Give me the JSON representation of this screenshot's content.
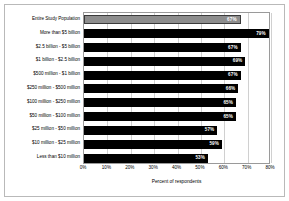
{
  "chart_data": {
    "type": "bar",
    "orientation": "horizontal",
    "title": "",
    "xlabel": "Percent of respondents",
    "ylabel": "",
    "xlim": [
      0,
      80
    ],
    "xticks": [
      "0%",
      "10%",
      "20%",
      "30%",
      "40%",
      "50%",
      "60%",
      "70%",
      "80%"
    ],
    "xtick_values": [
      0,
      10,
      20,
      30,
      40,
      50,
      60,
      70,
      80
    ],
    "grid": true,
    "legend": "none",
    "categories": [
      "Entire Study Population",
      "More than $5 billion",
      "$2.5 billion - $5 billion",
      "$1 billion - $2.5 billion",
      "$500 million - $1 billion",
      "$250 million - $500 million",
      "$100 million - $250 million",
      "$50 million - $100 million",
      "$25 million - $50 million",
      "$10 million - $25 million",
      "Less than $10 million"
    ],
    "values": [
      67,
      79,
      67,
      69,
      67,
      66,
      65,
      65,
      57,
      59,
      53
    ],
    "data_labels": [
      "67%",
      "79%",
      "67%",
      "69%",
      "67%",
      "66%",
      "65%",
      "65%",
      "57%",
      "59%",
      "53%"
    ],
    "bar_colors": [
      "#8d8d8d",
      "#000000",
      "#000000",
      "#000000",
      "#000000",
      "#000000",
      "#000000",
      "#000000",
      "#000000",
      "#000000",
      "#000000"
    ],
    "highlight_index": 0,
    "value_label_color": "#ffffff",
    "gridline_color": "#d0d0d0",
    "axis_color": "#9a9a9a"
  }
}
